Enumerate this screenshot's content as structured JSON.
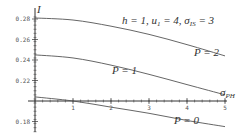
{
  "chart_data": {
    "type": "line",
    "title": "",
    "xlabel": "σ_PH",
    "ylabel": "I",
    "parameters_annotation": "h = 1, u1 = 4, σ_IS = 3",
    "xlim": [
      0,
      5
    ],
    "ylim": [
      0.17,
      0.29
    ],
    "x_axis_crosses_y_at": 0.2,
    "x_ticks": [
      "1",
      "2",
      "3",
      "4",
      "5"
    ],
    "y_ticks": [
      "0.28",
      "0.26",
      "0.24",
      "0.22",
      "0.18"
    ],
    "grid": false,
    "legend": "inline labels",
    "x": [
      0,
      1,
      2,
      3,
      4,
      5
    ],
    "series": [
      {
        "name": "P = 2",
        "label_text": "P = 2",
        "values": [
          0.281,
          0.279,
          0.273,
          0.265,
          0.255,
          0.244
        ]
      },
      {
        "name": "P = 1",
        "label_text": "P = 1",
        "values": [
          0.245,
          0.242,
          0.235,
          0.226,
          0.216,
          0.206
        ]
      },
      {
        "name": "P = 0",
        "label_text": "P = 0",
        "values": [
          0.204,
          0.2,
          0.194,
          0.188,
          0.181,
          0.175
        ]
      }
    ]
  },
  "labels": {
    "y_axis_symbol": "I",
    "x_axis_symbol": "σ",
    "x_axis_sub": "PH",
    "params": "h = 1, u",
    "params_sub1": "1",
    "params_mid": " = 4, σ",
    "params_sub2": "IS",
    "params_end": " = 3",
    "p2": "P = 2",
    "p1": "P = 1",
    "p0": "P = 0"
  },
  "colors": {
    "axis": "#333333",
    "curve": "#555555",
    "text": "#333333"
  }
}
